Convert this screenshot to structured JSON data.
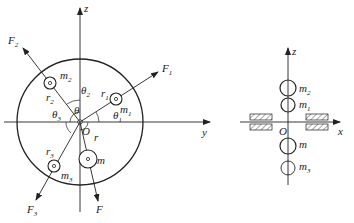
{
  "left_diagram": {
    "axes": {
      "vertical": "z",
      "horizontal": "y",
      "origin": "O"
    },
    "angles": {
      "theta1": "θ1",
      "theta2": "θ2",
      "theta3": "θ3",
      "theta": "θ"
    },
    "masses": [
      {
        "name": "m",
        "sub": "1",
        "radius": "r",
        "radius_sub": "1",
        "force": "F",
        "force_sub": "1"
      },
      {
        "name": "m",
        "sub": "2",
        "radius": "r",
        "radius_sub": "2",
        "force": "F",
        "force_sub": "2"
      },
      {
        "name": "m",
        "sub": "3",
        "radius": "r",
        "radius_sub": "3",
        "force": "F",
        "force_sub": "3"
      },
      {
        "name": "m",
        "sub": "",
        "radius": "r",
        "radius_sub": "",
        "force": "F",
        "force_sub": ""
      }
    ]
  },
  "right_diagram": {
    "axes": {
      "vertical": "z",
      "horizontal": "x",
      "origin": "O"
    },
    "masses_top_to_bottom": [
      "m2",
      "m1",
      "m",
      "m3"
    ]
  },
  "labels": {
    "z": "z",
    "y": "y",
    "x": "x",
    "O": "O",
    "theta": "θ",
    "m": "m",
    "r": "r",
    "F": "F",
    "s1": "1",
    "s2": "2",
    "s3": "3"
  }
}
